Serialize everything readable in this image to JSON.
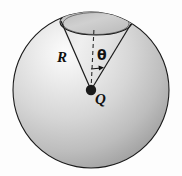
{
  "figure": {
    "labels": {
      "radius": "R",
      "charge": "Q",
      "angle": "θ"
    },
    "colors": {
      "background": "#fdfdfd",
      "outline": "#1a1a1a",
      "sphere_light": "#f2f2f2",
      "sphere_mid": "#c9c9c9",
      "sphere_dark": "#8f8f8f",
      "cone_light": "#ededed",
      "cone_mid": "#d5d5d5",
      "charge_dot": "#1a1a1a"
    },
    "geometry": {
      "sphere_center_x": 91,
      "sphere_center_y": 90,
      "sphere_radius": 78,
      "cap_center_x": 96,
      "cap_center_y": 22,
      "cap_rx": 36,
      "cap_ry": 13,
      "axis_top_y": 28,
      "charge_x": 91,
      "charge_y": 90,
      "charge_dot_radius": 5,
      "angle_arrow_y": 68,
      "angle_arrow_x_end": 102
    },
    "elements": {
      "sphere": "sphere-body",
      "cap": "cone-cap-ellipse",
      "cone_left_edge": "cone-left-generator",
      "cone_right_edge": "cone-right-generator",
      "axis": "dashed-center-axis",
      "arrow": "angle-arrow",
      "dot": "point-charge-dot"
    }
  }
}
